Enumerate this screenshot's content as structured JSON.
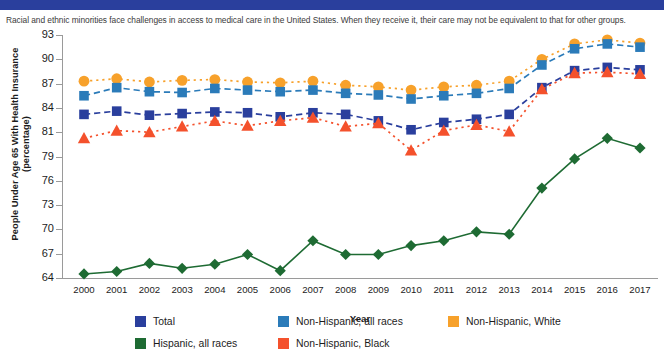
{
  "banner": {
    "color": "#2a3f9d"
  },
  "subtitle": "Racial and ethnic minorities face challenges in access to medical care in the United States. When they receive it, their care may not be equivalent to that for other groups.",
  "axes": {
    "y_title": "People Under Age 65 With Health Insurance (percentage)",
    "x_title": "Year"
  },
  "legend": {
    "items": [
      {
        "label": "Total",
        "color": "#2a3f9d"
      },
      {
        "label": "Non-Hispanic, all races",
        "color": "#2b7bb9"
      },
      {
        "label": "Non-Hispanic, White",
        "color": "#f7a12b"
      },
      {
        "label": "Hispanic, all races",
        "color": "#1e6b33"
      },
      {
        "label": "Non-Hispanic, Black",
        "color": "#f4512c"
      }
    ]
  },
  "chart_data": {
    "type": "line",
    "title": "",
    "subtitle": "Racial and ethnic minorities face challenges in access to medical care in the United States. When they receive it, their care may not be equivalent to that for other groups.",
    "xlabel": "Year",
    "ylabel": "People Under Age 65 With Health Insurance (percentage)",
    "grid": false,
    "legend_position": "bottom",
    "x": [
      2000,
      2001,
      2002,
      2003,
      2004,
      2005,
      2006,
      2007,
      2008,
      2009,
      2010,
      2011,
      2012,
      2013,
      2014,
      2015,
      2016,
      2017
    ],
    "ytick_labels": [
      "93",
      "90",
      "87",
      "84",
      "81",
      "79",
      "76",
      "73",
      "70",
      "67",
      "64"
    ],
    "ytick_values": [
      93,
      90,
      87,
      84,
      81,
      79,
      76,
      73,
      70,
      67,
      64
    ],
    "ylim": [
      64,
      93
    ],
    "series": [
      {
        "name": "Non-Hispanic, White",
        "color": "#f7a12b",
        "marker": "circle",
        "linestyle": "dotted",
        "values": [
          87.3,
          87.6,
          87.2,
          87.4,
          87.5,
          87.2,
          87.1,
          87.3,
          86.8,
          86.6,
          86.2,
          86.6,
          86.8,
          87.3,
          90.0,
          91.9,
          92.4,
          92.0
        ]
      },
      {
        "name": "Non-Hispanic, all races",
        "color": "#2b7bb9",
        "marker": "square",
        "linestyle": "dashed",
        "values": [
          85.5,
          86.5,
          86.0,
          85.9,
          86.4,
          86.2,
          86.0,
          86.2,
          85.8,
          85.6,
          85.1,
          85.5,
          85.8,
          86.4,
          89.3,
          91.3,
          91.9,
          91.5
        ]
      },
      {
        "name": "Total",
        "color": "#2a3f9d",
        "marker": "square",
        "linestyle": "dashed",
        "values": [
          83.2,
          83.6,
          83.1,
          83.3,
          83.5,
          83.4,
          82.9,
          83.4,
          83.2,
          82.4,
          81.3,
          82.2,
          82.6,
          83.2,
          86.5,
          88.6,
          89.0,
          88.7
        ]
      },
      {
        "name": "Non-Hispanic, Black",
        "color": "#f4512c",
        "marker": "triangle",
        "linestyle": "dotted",
        "values": [
          80.5,
          81.2,
          81.0,
          81.7,
          82.4,
          81.8,
          82.4,
          82.8,
          81.7,
          82.1,
          79.5,
          81.2,
          81.9,
          81.1,
          86.3,
          88.3,
          88.4,
          88.2
        ]
      },
      {
        "name": "Hispanic, all races",
        "color": "#1e6b33",
        "marker": "diamond",
        "linestyle": "solid",
        "values": [
          64.5,
          64.8,
          65.8,
          65.2,
          65.7,
          66.9,
          64.9,
          68.6,
          66.9,
          66.9,
          68.0,
          68.6,
          69.7,
          69.4,
          75.1,
          78.7,
          80.5,
          79.7
        ]
      }
    ]
  }
}
